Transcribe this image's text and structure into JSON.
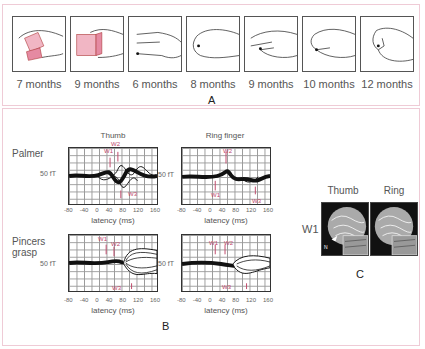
{
  "panel_a": {
    "letter": "A",
    "stages": [
      {
        "age": "7 months",
        "grasp": "palmar-cube"
      },
      {
        "age": "9 months",
        "grasp": "radial-cube"
      },
      {
        "age": "6 months",
        "grasp": "open-fingers"
      },
      {
        "age": "8 months",
        "grasp": "raking"
      },
      {
        "age": "9 months",
        "grasp": "inferior-pincer"
      },
      {
        "age": "10 months",
        "grasp": "pincer"
      },
      {
        "age": "12 months",
        "grasp": "superior-pincer"
      }
    ],
    "accent_color": "#e8a7b8"
  },
  "panel_b": {
    "letter": "B",
    "columns": [
      "Thumb",
      "Ring finger"
    ],
    "rows": [
      "Palmer",
      "Pincers grasp"
    ],
    "scale_label": "50 fT",
    "x_ticks": [
      "-80",
      "-40",
      "0",
      "40",
      "80",
      "120",
      "160"
    ],
    "x_label": "latency  (ms)",
    "annotation_color": "#c0486a",
    "plots": [
      {
        "row": "Palmer",
        "col": "Thumb",
        "markers": [
          "W1",
          "W2",
          "W3"
        ]
      },
      {
        "row": "Palmer",
        "col": "Ring finger",
        "markers": [
          "W2",
          "W1",
          "W3"
        ]
      },
      {
        "row": "Pincers grasp",
        "col": "Thumb",
        "markers": [
          "W1",
          "W2",
          "W3"
        ]
      },
      {
        "row": "Pincers grasp",
        "col": "Ring finger",
        "markers": [
          "W1",
          "W2",
          "W3"
        ]
      }
    ]
  },
  "panel_c": {
    "letter": "C",
    "row_label": "W1",
    "columns": [
      "Thumb",
      "Ring"
    ],
    "inset_label": "N"
  }
}
